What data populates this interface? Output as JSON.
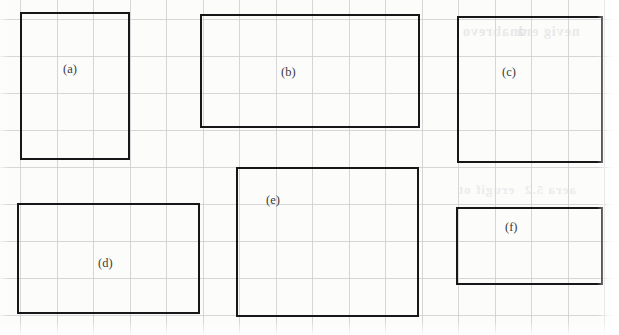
{
  "page": {
    "background_color": "#fcfcfb",
    "ink_color": "#17171a",
    "grid_color": "#cfcfcf",
    "label_color": "#3a3a3c",
    "width": 619,
    "height": 335
  },
  "grid": {
    "cell_width": 36.5,
    "cell_height": 37,
    "vertical_lines_x": [
      20,
      56.5,
      93,
      129.5,
      166,
      202.5,
      239,
      275.5,
      312,
      348.5,
      385,
      421.5,
      458,
      494.5,
      531,
      567.5,
      604
    ],
    "horizontal_lines_y": [
      19,
      56,
      93,
      130,
      167,
      204,
      241,
      278,
      315
    ],
    "visible": true
  },
  "bleed_through": [
    {
      "text": "dnabrevo",
      "x": 462,
      "y": 24,
      "size": 14,
      "opacity": 0.55
    },
    {
      "text": "nevig era",
      "x": 516,
      "y": 24,
      "size": 14,
      "opacity": 0.5
    },
    {
      "text": "erugif ot",
      "x": 458,
      "y": 182,
      "size": 13,
      "opacity": 0.45
    },
    {
      "text": "aera 5.2",
      "x": 524,
      "y": 182,
      "size": 13,
      "opacity": 0.45
    }
  ],
  "rectangles": [
    {
      "id": "a",
      "label": "(a)",
      "x": 20,
      "y": 12,
      "width": 110,
      "height": 148,
      "label_x": 63,
      "label_y": 62
    },
    {
      "id": "b",
      "label": "(b)",
      "x": 200,
      "y": 14,
      "width": 220,
      "height": 114,
      "label_x": 281,
      "label_y": 65
    },
    {
      "id": "c",
      "label": "(c)",
      "x": 457,
      "y": 16,
      "width": 146,
      "height": 147,
      "label_x": 502,
      "label_y": 65
    },
    {
      "id": "d",
      "label": "(d)",
      "x": 17,
      "y": 203,
      "width": 183,
      "height": 111,
      "label_x": 98,
      "label_y": 256
    },
    {
      "id": "e",
      "label": "(e)",
      "x": 236,
      "y": 167,
      "width": 183,
      "height": 150,
      "label_x": 266,
      "label_y": 193
    },
    {
      "id": "f",
      "label": "(f)",
      "x": 456,
      "y": 207,
      "width": 147,
      "height": 78,
      "label_x": 505,
      "label_y": 220
    }
  ]
}
